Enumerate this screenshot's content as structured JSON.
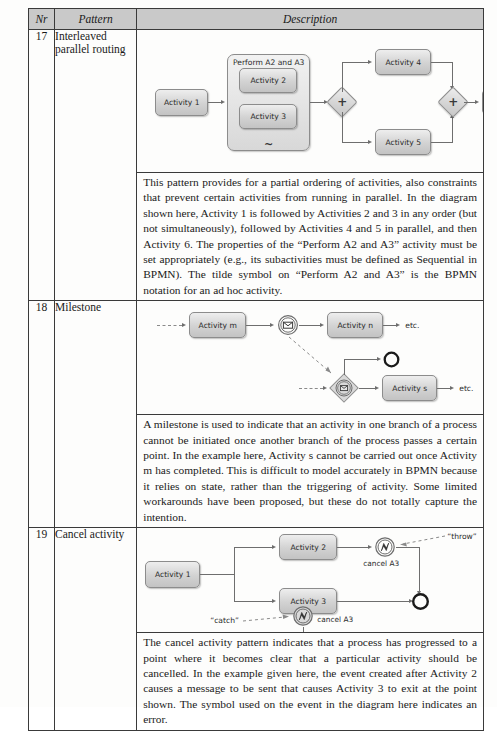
{
  "table": {
    "headers": [
      "Nr",
      "Pattern",
      "Description"
    ],
    "rows": [
      {
        "nr": "17",
        "pattern": "Interleaved parallel routing",
        "description": "This pattern provides for a partial ordering of activities, also constraints that prevent certain activities from running in parallel. In the diagram shown here, Activity 1 is followed by Activities 2 and 3 in any order (but not simultaneously), followed by Activities 4 and 5 in parallel, and then Activity 6. The properties of the “Perform A2 and A3” activity must be set appropriately (e.g., its subactivities must be defined as Sequential in BPMN). The tilde symbol on “Perform A2 and A3” is the BPMN notation for an ad hoc activity.",
        "diagram": {
          "type": "bpmn",
          "nodes": [
            {
              "id": "a1",
              "kind": "task",
              "label": "Activity 1"
            },
            {
              "id": "sub",
              "kind": "subprocess",
              "label": "Perform A2 and A3",
              "marker": "ad-hoc-tilde"
            },
            {
              "id": "a2",
              "kind": "task",
              "label": "Activity 2"
            },
            {
              "id": "a3",
              "kind": "task",
              "label": "Activity 3"
            },
            {
              "id": "gw1",
              "kind": "gateway-parallel",
              "label": "+"
            },
            {
              "id": "a4",
              "kind": "task",
              "label": "Activity 4"
            },
            {
              "id": "a5",
              "kind": "task",
              "label": "Activity 5"
            },
            {
              "id": "gw2",
              "kind": "gateway-parallel",
              "label": "+"
            },
            {
              "id": "a6",
              "kind": "task",
              "label": "Activity 6"
            },
            {
              "id": "etc1",
              "kind": "text",
              "label": "etc."
            }
          ]
        }
      },
      {
        "nr": "18",
        "pattern": "Milestone",
        "description": "A milestone is used to indicate that an activity in one branch of a process cannot be initiated once another branch of the process passes a certain point. In the example here, Activity s cannot be carried out once Activity m has completed. This is difficult to model accurately in BPMN because it relies on state, rather than the triggering of activity. Some limited workarounds have been proposed, but these do not totally capture the intention.",
        "diagram": {
          "type": "bpmn",
          "nodes": [
            {
              "id": "am",
              "kind": "task",
              "label": "Activity m"
            },
            {
              "id": "msg1",
              "kind": "event-message-throw",
              "label": ""
            },
            {
              "id": "an",
              "kind": "task",
              "label": "Activity n"
            },
            {
              "id": "etc2",
              "kind": "text",
              "label": "etc."
            },
            {
              "id": "end1",
              "kind": "event-end",
              "label": ""
            },
            {
              "id": "gwev",
              "kind": "gateway-event-based",
              "label": ""
            },
            {
              "id": "as",
              "kind": "task",
              "label": "Activity s"
            },
            {
              "id": "etc3",
              "kind": "text",
              "label": "etc."
            }
          ]
        }
      },
      {
        "nr": "19",
        "pattern": "Cancel activity",
        "description": "The cancel activity pattern indicates that a process has progressed to a point where it becomes clear that a particular activity should be cancelled. In the example given here, the event created after Activity 2 causes  a message to be sent that causes Activity 3 to exit at the point shown. The symbol used on the event in the diagram here indicates an error.",
        "diagram": {
          "type": "bpmn",
          "nodes": [
            {
              "id": "c1",
              "kind": "task",
              "label": "Activity 1"
            },
            {
              "id": "c2",
              "kind": "task",
              "label": "Activity 2"
            },
            {
              "id": "c3",
              "kind": "task",
              "label": "Activity 3"
            },
            {
              "id": "ethrow",
              "kind": "event-error-throw",
              "label": "cancel A3"
            },
            {
              "id": "ecatch",
              "kind": "event-error-catch",
              "label": "cancel A3"
            },
            {
              "id": "endc",
              "kind": "event-end",
              "label": ""
            },
            {
              "id": "lthrow",
              "kind": "text",
              "label": "“throw”"
            },
            {
              "id": "lcatch",
              "kind": "text",
              "label": "“catch”"
            }
          ]
        }
      }
    ]
  },
  "labels": {
    "activity1": "Activity 1",
    "activity2": "Activity 2",
    "activity3": "Activity 3",
    "activity4": "Activity 4",
    "activity5": "Activity 5",
    "activity6": "Activity 6",
    "perform": "Perform A2 and A3",
    "tilde": "~",
    "plus": "+",
    "etc": "etc.",
    "activity_m": "Activity m",
    "activity_n": "Activity n",
    "activity_s": "Activity s",
    "cancel_a3": "cancel A3",
    "throw": "“throw”",
    "catch": "“catch”"
  },
  "colors": {
    "header_bg": "#c9c9c9",
    "border": "#3a3a3a",
    "shape_fill": "#d2d2d2",
    "shape_stroke": "#8c8c8c",
    "connector": "#6e6e6e",
    "page_bg": "#fdfdfc"
  }
}
